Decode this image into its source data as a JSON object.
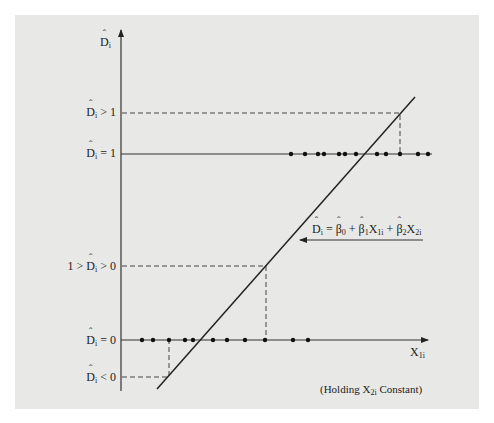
{
  "diagram": {
    "y_axis": {
      "label_var": "D",
      "label_sub": "i"
    },
    "x_axis": {
      "label_var": "X",
      "label_sub": "1i"
    },
    "levels": [
      {
        "id": "gt1",
        "prefix": "",
        "var": "D",
        "sub": "i",
        "rel": " > 1",
        "y": 113
      },
      {
        "id": "eq1",
        "prefix": "",
        "var": "D",
        "sub": "i",
        "rel": " = 1",
        "y": 153
      },
      {
        "id": "between",
        "prefix": "1 > ",
        "var": "D",
        "sub": "i",
        "rel": " > 0",
        "y": 266
      },
      {
        "id": "eq0",
        "prefix": "",
        "var": "D",
        "sub": "i",
        "rel": " = 0",
        "y": 340
      },
      {
        "id": "lt0",
        "prefix": "",
        "var": "D",
        "sub": "i",
        "rel": " < 0",
        "y": 377
      }
    ],
    "equation": "D̂ᵢ = β̂₀ + β̂₁X₁ᵢ + β̂₂X₂ᵢ",
    "equation_parts": {
      "lhs": "D",
      "lhs_sub": "i",
      "eq": " = ",
      "b0": "β",
      "b0_sub": "0",
      "plus1": " + ",
      "b1": "β",
      "b1_sub": "1",
      "x1": "X",
      "x1_sub": "1i",
      "plus2": " + ",
      "b2": "β",
      "b2_sub": "2",
      "x2": "X",
      "x2_sub": "2i"
    },
    "note": {
      "text_before": "(Holding X",
      "sub": "2i",
      "text_after": " Constant)"
    },
    "points_d1_x": [
      291,
      305,
      318,
      324,
      339,
      345,
      356,
      377,
      386,
      400,
      418,
      428
    ],
    "points_d0_x": [
      142,
      153,
      169,
      185,
      193,
      213,
      227,
      245,
      265,
      293,
      308
    ],
    "colors": {
      "panel": "#e8e8e6",
      "ink": "#222222"
    }
  }
}
